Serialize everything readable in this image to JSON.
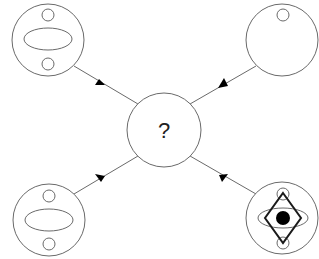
{
  "diagram": {
    "type": "puzzle-hub",
    "center": {
      "label": "?",
      "cx": 164,
      "cy": 130,
      "r": 37
    },
    "colors": {
      "stroke": "#6a6a6a",
      "bold": "#1a1a1a",
      "fill": "#000000",
      "background": "#ffffff"
    },
    "nodes": [
      {
        "id": "top-left",
        "cx": 48,
        "cy": 40,
        "r": 36,
        "contents": [
          "small-circle-top",
          "horizontal-ellipse",
          "small-circle-bottom"
        ]
      },
      {
        "id": "top-right",
        "cx": 282,
        "cy": 40,
        "r": 36,
        "contents": [
          "small-circle-top"
        ]
      },
      {
        "id": "bottom-left",
        "cx": 49,
        "cy": 220,
        "r": 36,
        "contents": [
          "small-circle-top",
          "horizontal-ellipse",
          "small-circle-bottom"
        ]
      },
      {
        "id": "bottom-right",
        "cx": 282,
        "cy": 218,
        "r": 36,
        "contents": [
          "small-circle-top",
          "horizontal-ellipse",
          "small-circle-bottom",
          "diamond",
          "filled-dot"
        ]
      }
    ],
    "edges": [
      {
        "from": "top-left",
        "to": "center",
        "arrow": "toward-center"
      },
      {
        "from": "top-right",
        "to": "center",
        "arrow": "toward-center"
      },
      {
        "from": "bottom-left",
        "to": "center",
        "arrow": "toward-center"
      },
      {
        "from": "bottom-right",
        "to": "center",
        "arrow": "toward-center"
      }
    ]
  }
}
